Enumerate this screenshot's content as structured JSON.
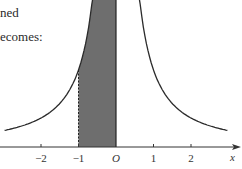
{
  "text": {
    "line1": "ned",
    "line2": "ecomes:"
  },
  "figure": {
    "axis_label": "x",
    "origin_label": "O",
    "ticks": [
      {
        "value": -2,
        "label": "−2"
      },
      {
        "value": -1,
        "label": "−1"
      },
      {
        "value": 1,
        "label": "1"
      },
      {
        "value": 2,
        "label": "2"
      }
    ],
    "shaded_region": {
      "from": -1,
      "to": 0,
      "color": "#6e6e6e"
    },
    "curve": {
      "type": "symmetric decaying curve about y-axis",
      "x_range": [
        -3,
        3
      ]
    },
    "colors": {
      "curve": "#2b2b2b",
      "axis": "#333333",
      "shade": "#6e6e6e"
    }
  },
  "chart_data": {
    "type": "line",
    "title": "",
    "xlabel": "x",
    "ylabel": "",
    "x_ticks": [
      -2,
      -1,
      0,
      1,
      2
    ],
    "x_tick_labels": [
      "−2",
      "−1",
      "O",
      "1",
      "2"
    ],
    "xlim": [
      -3.1,
      3.3
    ],
    "series": [
      {
        "name": "curve",
        "description": "symmetric curve, tends to infinity at x=0, decays as |x| grows",
        "x": [
          -3,
          -2,
          -1,
          -0.55,
          0.55,
          1,
          2,
          3
        ],
        "y_relative": [
          0.2,
          0.38,
          1.0,
          2.3,
          2.3,
          1.0,
          0.38,
          0.2
        ]
      }
    ],
    "shaded_area": {
      "x_from": -1,
      "x_to": 0,
      "boundary_left": "dashed vertical line at x=-1",
      "boundary_right": "y-axis (solid)"
    },
    "grid": false,
    "legend": null
  }
}
